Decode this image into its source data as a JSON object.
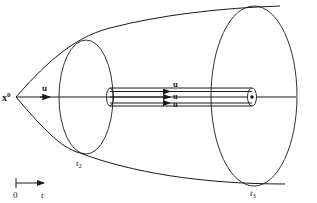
{
  "diagram": {
    "origin_label": "x",
    "origin_sup": "0",
    "vector_label": "u",
    "tube_labels": [
      "u",
      "u",
      "u"
    ],
    "cross_sections": [
      {
        "label": "t",
        "sub": "2"
      },
      {
        "label": "t",
        "sub": "3"
      }
    ],
    "time_axis": {
      "start": "0",
      "end": "t"
    },
    "colors": {
      "stroke": "#1a1a1a",
      "background": "#ffffff"
    }
  }
}
